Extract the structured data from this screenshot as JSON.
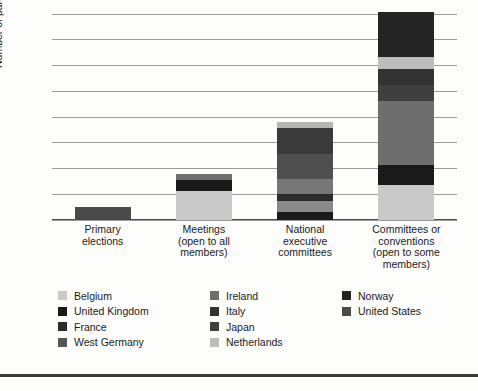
{
  "chart_data": {
    "type": "bar",
    "subtype": "stacked-bar",
    "title": "",
    "xlabel": "",
    "ylabel": "Number of parties",
    "ylim": [
      0,
      32
    ],
    "yticks": [
      0,
      4,
      8,
      12,
      16,
      20,
      24,
      28,
      32
    ],
    "ytick_labels": [
      "0",
      "4",
      "8",
      "12",
      "16",
      "20",
      "24",
      "28",
      "32"
    ],
    "grid": true,
    "legend_position": "bottom",
    "categories": [
      "Primary\nelections",
      "Meetings\n(open to all\nmembers)",
      "National\nexecutive\ncommittees",
      "Committees or\nconventions\n(open to some\nmembers)"
    ],
    "series": [
      {
        "name": "Belgium",
        "color": "#c9c9c9",
        "values": [
          0,
          4.5,
          0,
          5.5
        ]
      },
      {
        "name": "United Kingdom",
        "color": "#1a1a1a",
        "values": [
          0,
          1.7,
          1.3,
          3.0
        ]
      },
      {
        "name": "France",
        "color": "#2b2b2b",
        "values": [
          0,
          0,
          1.7,
          0
        ]
      },
      {
        "name": "West Germany",
        "color": "#565656",
        "values": [
          0,
          0,
          1.0,
          0
        ]
      },
      {
        "name": "Ireland",
        "color": "#6e6e6e",
        "values": [
          0,
          1.0,
          2.3,
          10.0
        ]
      },
      {
        "name": "Italy",
        "color": "#333333",
        "values": [
          0,
          0,
          4.0,
          2.5
        ]
      },
      {
        "name": "Japan",
        "color": "#3f3f3f",
        "values": [
          0,
          0,
          4.0,
          2.5
        ]
      },
      {
        "name": "Netherlands",
        "color": "#bdbdbd",
        "values": [
          0,
          0,
          1.0,
          1.8
        ]
      },
      {
        "name": "Norway",
        "color": "#242424",
        "values": [
          0,
          0,
          0,
          7.0
        ]
      },
      {
        "name": "United States",
        "color": "#4a4a4a",
        "values": [
          2.0,
          0,
          0,
          0
        ]
      }
    ],
    "bar_totals": [
      2.0,
      7.2,
      15.3,
      32.3
    ],
    "stacks": [
      {
        "category": "Primary elections",
        "segments": [
          {
            "name": "United States",
            "value": 2.0,
            "color": "#4a4a4a"
          }
        ]
      },
      {
        "category": "Meetings (open to all members)",
        "segments": [
          {
            "name": "Belgium",
            "value": 4.5,
            "color": "#c9c9c9"
          },
          {
            "name": "United Kingdom",
            "value": 1.7,
            "color": "#1a1a1a"
          },
          {
            "name": "Ireland",
            "value": 1.0,
            "color": "#6e6e6e"
          }
        ]
      },
      {
        "category": "National executive committees",
        "segments": [
          {
            "name": "United Kingdom",
            "value": 1.3,
            "color": "#1a1a1a"
          },
          {
            "name": "Ireland",
            "value": 1.7,
            "color": "#8a8a8a"
          },
          {
            "name": "France",
            "value": 1.0,
            "color": "#2b2b2b"
          },
          {
            "name": "West Germany",
            "value": 2.3,
            "color": "#777777"
          },
          {
            "name": "Italy",
            "value": 4.0,
            "color": "#4f4f4f"
          },
          {
            "name": "Japan",
            "value": 4.0,
            "color": "#3a3a3a"
          },
          {
            "name": "Netherlands",
            "value": 1.0,
            "color": "#b5b5b5"
          }
        ]
      },
      {
        "category": "Committees or conventions (open to some members)",
        "segments": [
          {
            "name": "Belgium",
            "value": 5.5,
            "color": "#c9c9c9"
          },
          {
            "name": "United Kingdom",
            "value": 3.0,
            "color": "#1a1a1a"
          },
          {
            "name": "United States",
            "value": 10.0,
            "color": "#6e6e6e"
          },
          {
            "name": "Japan",
            "value": 2.5,
            "color": "#3f3f3f"
          },
          {
            "name": "Italy",
            "value": 2.5,
            "color": "#333333"
          },
          {
            "name": "Netherlands",
            "value": 1.8,
            "color": "#bdbdbd"
          },
          {
            "name": "Norway",
            "value": 7.0,
            "color": "#242424"
          }
        ]
      }
    ],
    "legend": {
      "columns": [
        [
          {
            "label": "Belgium",
            "color": "#c9c9c9"
          },
          {
            "label": "United Kingdom",
            "color": "#1a1a1a"
          },
          {
            "label": "France",
            "color": "#2b2b2b"
          },
          {
            "label": "West Germany",
            "color": "#565656"
          }
        ],
        [
          {
            "label": "Ireland",
            "color": "#6e6e6e"
          },
          {
            "label": "Italy",
            "color": "#333333"
          },
          {
            "label": "Japan",
            "color": "#3f3f3f"
          },
          {
            "label": "Netherlands",
            "color": "#bdbdbd"
          }
        ],
        [
          {
            "label": "Norway",
            "color": "#242424"
          },
          {
            "label": "United States",
            "color": "#4a4a4a"
          }
        ]
      ]
    },
    "colors": {
      "background": "#fdfdfb",
      "gridline": "#9b9b9b",
      "axis": "#4d4d4d",
      "text": "#1a1a1a",
      "bottom_rule": "#3a3a3a"
    }
  }
}
